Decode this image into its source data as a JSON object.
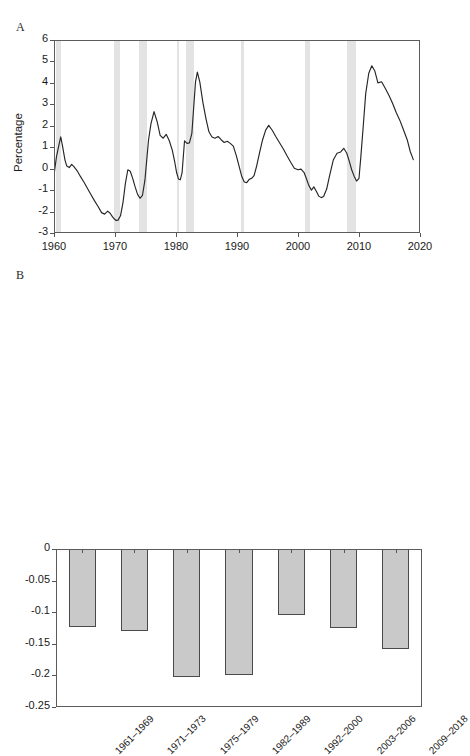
{
  "figure": {
    "panel_a_letter": "A",
    "panel_b_letter": "B",
    "colors": {
      "line": "#262626",
      "recession_band": "#e3e3e3",
      "bar_fill": "#c9c9c9",
      "bar_border": "#4a4a4a",
      "axis": "#5b5b5b"
    }
  },
  "chart_data": [
    {
      "id": "panel-a",
      "type": "line",
      "title": "",
      "xlabel": "",
      "ylabel": "Percentage",
      "xlim": [
        1960,
        2020
      ],
      "ylim": [
        -3,
        6
      ],
      "xticks": [
        "1960",
        "1970",
        "1980",
        "1990",
        "2000",
        "2010",
        "2020"
      ],
      "xtick_values": [
        1960,
        1970,
        1980,
        1990,
        2000,
        2010,
        2020
      ],
      "yticks": [
        "6",
        "5",
        "4",
        "3",
        "2",
        "1",
        "0",
        "-1",
        "-2",
        "-3"
      ],
      "ytick_values": [
        6,
        5,
        4,
        3,
        2,
        1,
        0,
        -1,
        -2,
        -3
      ],
      "grid": false,
      "legend": "none",
      "recession_bands": [
        {
          "start": 1960.3,
          "end": 1961.2
        },
        {
          "start": 1969.9,
          "end": 1970.9
        },
        {
          "start": 1973.9,
          "end": 1975.2
        },
        {
          "start": 1980.1,
          "end": 1980.5
        },
        {
          "start": 1981.6,
          "end": 1982.9
        },
        {
          "start": 1990.6,
          "end": 1991.2
        },
        {
          "start": 2001.2,
          "end": 2001.9
        },
        {
          "start": 2008.0,
          "end": 2009.5
        }
      ],
      "series": [
        {
          "name": "Percentage",
          "x": [
            1960.0,
            1960.4,
            1960.8,
            1961.1,
            1961.4,
            1961.8,
            1962.1,
            1962.5,
            1962.9,
            1963.3,
            1963.8,
            1964.3,
            1964.9,
            1965.4,
            1966.0,
            1966.6,
            1967.2,
            1967.8,
            1968.3,
            1968.8,
            1969.2,
            1969.6,
            1969.9,
            1970.2,
            1970.5,
            1970.9,
            1971.3,
            1971.7,
            1972.1,
            1972.5,
            1972.9,
            1973.3,
            1973.7,
            1974.1,
            1974.5,
            1974.9,
            1975.2,
            1975.5,
            1975.9,
            1976.4,
            1976.9,
            1977.4,
            1977.9,
            1978.4,
            1978.9,
            1979.4,
            1979.8,
            1980.1,
            1980.4,
            1980.7,
            1981.0,
            1981.4,
            1981.8,
            1982.2,
            1982.6,
            1982.9,
            1983.2,
            1983.5,
            1983.9,
            1984.4,
            1984.9,
            1985.4,
            1985.9,
            1986.4,
            1986.9,
            1987.4,
            1987.9,
            1988.4,
            1988.9,
            1989.4,
            1989.9,
            1990.4,
            1990.8,
            1991.2,
            1991.6,
            1992.0,
            1992.4,
            1992.8,
            1993.2,
            1993.7,
            1994.2,
            1994.7,
            1995.2,
            1995.8,
            1996.4,
            1997.0,
            1997.6,
            1998.2,
            1998.8,
            1999.4,
            2000.0,
            2000.5,
            2001.0,
            2001.4,
            2001.8,
            2002.2,
            2002.6,
            2003.0,
            2003.4,
            2003.8,
            2004.2,
            2004.7,
            2005.2,
            2005.8,
            2006.4,
            2007.0,
            2007.5,
            2008.0,
            2008.4,
            2008.8,
            2009.2,
            2009.6,
            2010.0,
            2010.3,
            2010.7,
            2011.1,
            2011.6,
            2012.1,
            2012.6,
            2013.1,
            2013.7,
            2014.3,
            2014.9,
            2015.5,
            2016.1,
            2016.7,
            2017.3,
            2017.9,
            2018.4,
            2018.9
          ],
          "y": [
            -0.3,
            0.55,
            1.1,
            1.48,
            1.05,
            0.4,
            0.12,
            0.05,
            0.2,
            0.08,
            -0.1,
            -0.35,
            -0.62,
            -0.88,
            -1.18,
            -1.48,
            -1.75,
            -2.05,
            -2.12,
            -1.98,
            -2.08,
            -2.25,
            -2.35,
            -2.42,
            -2.4,
            -2.2,
            -1.6,
            -0.7,
            -0.05,
            -0.12,
            -0.45,
            -0.85,
            -1.2,
            -1.38,
            -1.25,
            -0.55,
            0.4,
            1.35,
            2.1,
            2.66,
            2.2,
            1.55,
            1.42,
            1.6,
            1.3,
            0.85,
            0.3,
            -0.18,
            -0.48,
            -0.52,
            -0.18,
            1.3,
            1.18,
            1.2,
            1.65,
            2.85,
            4.05,
            4.5,
            4.05,
            3.1,
            2.35,
            1.72,
            1.48,
            1.42,
            1.5,
            1.35,
            1.22,
            1.28,
            1.18,
            1.05,
            0.6,
            0.05,
            -0.38,
            -0.62,
            -0.65,
            -0.5,
            -0.45,
            -0.32,
            0.1,
            0.75,
            1.35,
            1.8,
            2.02,
            1.78,
            1.48,
            1.2,
            0.92,
            0.6,
            0.3,
            0.02,
            -0.05,
            -0.02,
            -0.18,
            -0.48,
            -0.8,
            -1.0,
            -0.85,
            -1.05,
            -1.28,
            -1.35,
            -1.3,
            -0.95,
            -0.3,
            0.42,
            0.72,
            0.78,
            0.95,
            0.72,
            0.35,
            -0.05,
            -0.35,
            -0.58,
            -0.45,
            0.55,
            2.0,
            3.5,
            4.45,
            4.8,
            4.55,
            4.0,
            4.05,
            3.75,
            3.42,
            3.05,
            2.62,
            2.25,
            1.8,
            1.35,
            0.8,
            0.42,
            0.05,
            -0.02,
            -0.35,
            -0.62,
            -0.8,
            -0.92,
            -0.95
          ]
        }
      ]
    },
    {
      "id": "panel-b",
      "type": "bar",
      "title": "",
      "xlabel": "",
      "ylabel": "",
      "ylim": [
        -0.25,
        0
      ],
      "yticks": [
        "0",
        "-0.05",
        "-0.1",
        "-0.15",
        "-0.2",
        "-0.25"
      ],
      "ytick_values": [
        0,
        -0.05,
        -0.1,
        -0.15,
        -0.2,
        -0.25
      ],
      "grid": false,
      "legend": "none",
      "categories": [
        "1961–1969",
        "1971–1973",
        "1975–1979",
        "1982–1989",
        "1992–2000",
        "2003–2006",
        "2009–2018"
      ],
      "values": [
        -0.123,
        -0.129,
        -0.202,
        -0.199,
        -0.105,
        -0.125,
        -0.159
      ]
    }
  ]
}
